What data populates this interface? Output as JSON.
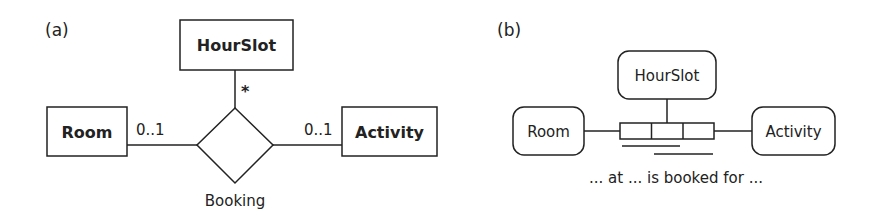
{
  "panel_a": {
    "label": "(a)",
    "entities": {
      "hourslot": "HourSlot",
      "room": "Room",
      "activity": "Activity"
    },
    "relationship": "Booking",
    "multiplicities": {
      "hourslot": "*",
      "room": "0..1",
      "activity": "0..1"
    }
  },
  "panel_b": {
    "label": "(b)",
    "object_types": {
      "hourslot": "HourSlot",
      "room": "Room",
      "activity": "Activity"
    },
    "fact_reading": "... at ... is booked for ..."
  },
  "colors": {
    "stroke": "#222222",
    "background": "#ffffff"
  }
}
